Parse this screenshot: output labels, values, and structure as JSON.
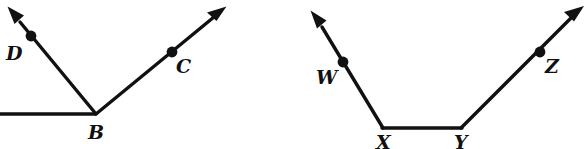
{
  "figure": {
    "stroke_color": "#111111",
    "background_color": "#ffffff",
    "stroke_width": 3.2,
    "dot_radius": 5.2,
    "diagrams": [
      {
        "name": "angle-DBC",
        "vertex": {
          "label": "B",
          "x": 96,
          "y": 114
        },
        "rays": [
          {
            "name": "ray-BA-horizontal-left",
            "from": {
              "x": 96,
              "y": 114
            },
            "to": {
              "x": -4,
              "y": 114
            },
            "arrowhead": false,
            "point": null
          },
          {
            "name": "ray-BD",
            "from": {
              "x": 96,
              "y": 114
            },
            "to": {
              "x": 10,
              "y": 10
            },
            "arrowhead": true,
            "point": {
              "label": "D",
              "x": 31,
              "y": 36
            }
          },
          {
            "name": "ray-BC",
            "from": {
              "x": 96,
              "y": 114
            },
            "to": {
              "x": 224,
              "y": 9
            },
            "arrowhead": true,
            "point": {
              "label": "C",
              "x": 172,
              "y": 52
            }
          }
        ]
      },
      {
        "name": "angle-WXYZ",
        "vertices": [
          {
            "label": "X",
            "x": 383,
            "y": 128
          },
          {
            "label": "Y",
            "x": 461,
            "y": 128
          }
        ],
        "rays": [
          {
            "name": "ray-XW",
            "from": {
              "x": 383,
              "y": 128
            },
            "to": {
              "x": 314,
              "y": 14
            },
            "arrowhead": true,
            "point": {
              "label": "W",
              "x": 343,
              "y": 62
            }
          },
          {
            "name": "segment-XY",
            "from": {
              "x": 383,
              "y": 128
            },
            "to": {
              "x": 461,
              "y": 128
            },
            "arrowhead": false,
            "point": null
          },
          {
            "name": "ray-YZ",
            "from": {
              "x": 461,
              "y": 128
            },
            "to": {
              "x": 581,
              "y": 9
            },
            "arrowhead": true,
            "point": {
              "label": "Z",
              "x": 540,
              "y": 52
            }
          }
        ]
      }
    ],
    "labels": {
      "D": "D",
      "C": "C",
      "B": "B",
      "W": "W",
      "Z": "Z",
      "X": "X",
      "Y": "Y"
    }
  }
}
